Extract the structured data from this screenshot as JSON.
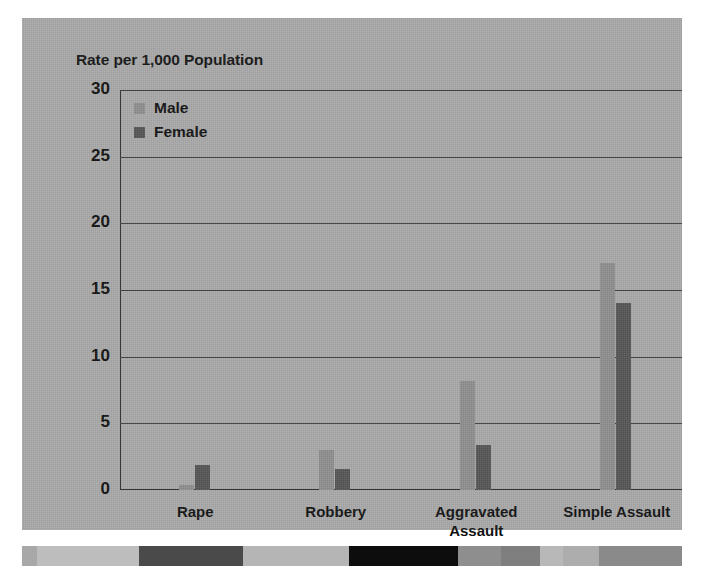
{
  "chart_data": {
    "type": "bar",
    "title": "Rate per 1,000 Population",
    "xlabel": "",
    "ylabel": "Rate per 1,000 Population",
    "categories": [
      "Rape",
      "Robbery",
      "Aggravated\nAssault",
      "Simple Assault"
    ],
    "series": [
      {
        "name": "Male",
        "color": "#8e8e8e",
        "values": [
          0.4,
          3.0,
          8.2,
          17.0
        ]
      },
      {
        "name": "Female",
        "color": "#555555",
        "values": [
          1.9,
          1.6,
          3.4,
          14.0
        ]
      }
    ],
    "ylim": [
      0,
      30
    ],
    "yticks": [
      0,
      5,
      10,
      15,
      20,
      25,
      30
    ],
    "ytick_labels": [
      "0",
      "5",
      "10",
      "15",
      "20",
      "25",
      "30"
    ],
    "grid": true,
    "legend_position": "top-left"
  },
  "figure": {
    "background_color": "#a9a9a9",
    "page_color": "#ffffff"
  },
  "decor_strip": {
    "blocks": [
      {
        "width": 4.5,
        "color": "#a8a8a8"
      },
      {
        "width": 31.0,
        "color": "#bdbdbd"
      },
      {
        "width": 31.5,
        "color": "#4a4a4a"
      },
      {
        "width": 32.0,
        "color": "#b5b5b5"
      },
      {
        "width": 33.0,
        "color": "#0d0d0d"
      },
      {
        "width": 13.0,
        "color": "#8e8e8e"
      },
      {
        "width": 12.0,
        "color": "#7f7f7f"
      },
      {
        "width": 7.0,
        "color": "#b8b8b8"
      },
      {
        "width": 11.0,
        "color": "#adadad"
      },
      {
        "width": 25.0,
        "color": "#8a8a8a"
      }
    ]
  }
}
